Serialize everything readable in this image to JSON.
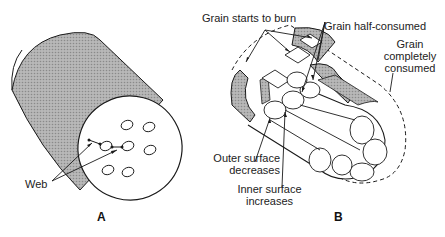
{
  "figure_a": {
    "label": "A",
    "callouts": {
      "web": "Web"
    }
  },
  "figure_b": {
    "label": "B",
    "callouts": {
      "starts": "Grain starts to burn",
      "half": "Grain half-consumed",
      "complete_line1": "Grain",
      "complete_line2": "completely",
      "complete_line3": "consumed",
      "outer_line1": "Outer surface",
      "outer_line2": "decreases",
      "inner_line1": "Inner surface",
      "inner_line2": "increases"
    }
  },
  "colors": {
    "shade": "#a9a9a9",
    "stroke": "#1a1a1a"
  }
}
